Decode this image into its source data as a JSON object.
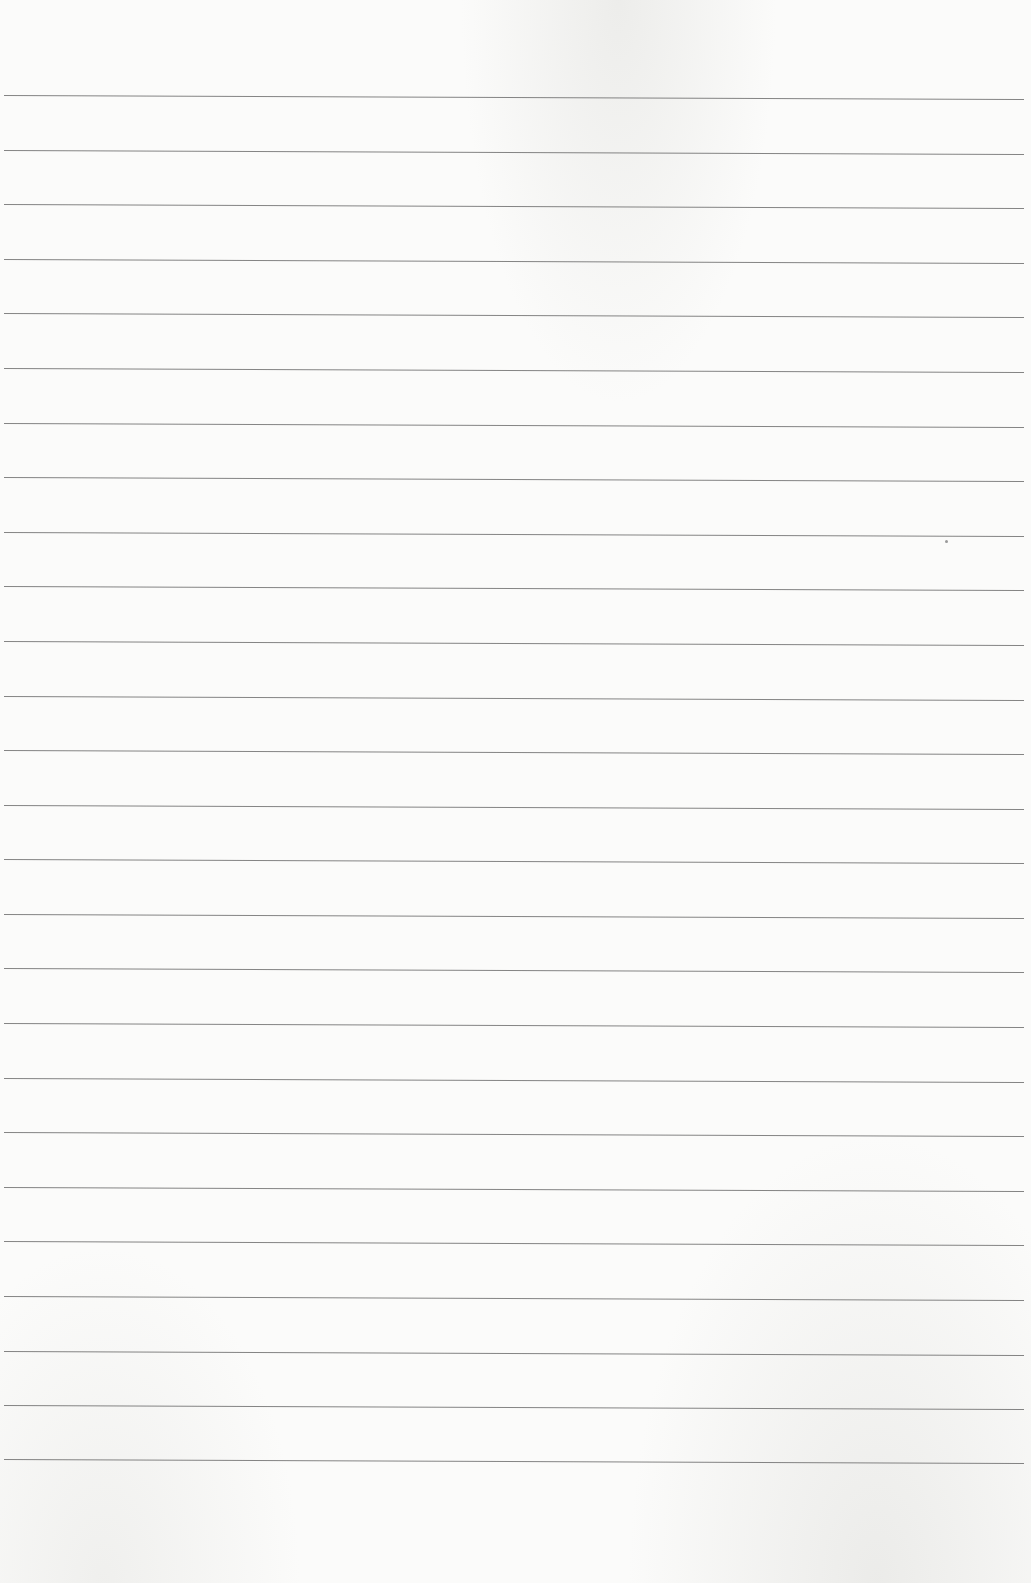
{
  "page": {
    "type": "blank-lined-paper",
    "background_color": "#fbfbfa",
    "rule_color": "#6e6e6e",
    "rule_count": 26,
    "first_rule_y": 96,
    "rule_spacing_px": 54.6,
    "rules": [
      96,
      151,
      205,
      260,
      314,
      369,
      424,
      478,
      533,
      587,
      642,
      697,
      751,
      806,
      860,
      915,
      969,
      1024,
      1079,
      1133,
      1188,
      1242,
      1297,
      1352,
      1406,
      1460
    ],
    "text_content": ""
  }
}
